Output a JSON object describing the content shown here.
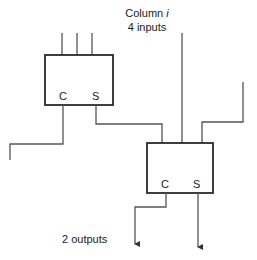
{
  "diagram": {
    "type": "carry-save adder column",
    "header": {
      "line1_prefix": "Column",
      "line1_var": "i",
      "line2": "4 inputs"
    },
    "footer": {
      "label": "2 outputs"
    },
    "blocks": [
      {
        "id": "adder-1",
        "inputs": 3,
        "ports": {
          "carry": "C",
          "sum": "S"
        }
      },
      {
        "id": "adder-2",
        "inputs": 3,
        "ports": {
          "carry": "C",
          "sum": "S"
        }
      }
    ],
    "colors": {
      "box_stroke": "#2a2a2a",
      "wire_stroke": "#555555",
      "background": "#ffffff"
    }
  }
}
